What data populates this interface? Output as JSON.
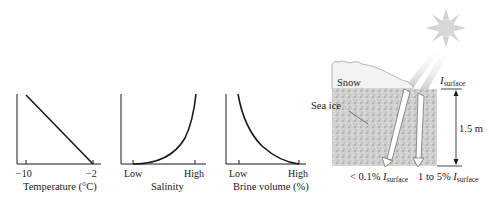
{
  "graphs": [
    {
      "id": "temperature",
      "xlabel": "Temperature (°C)",
      "ticks": [
        "−10",
        "−2"
      ],
      "trend": "linear decreasing"
    },
    {
      "id": "salinity",
      "xlabel": "Salinity",
      "ticks": [
        "Low",
        "High"
      ],
      "trend": "exponential increasing"
    },
    {
      "id": "brine",
      "xlabel": "Brine volume (%)",
      "ticks": [
        "Low",
        "High"
      ],
      "trend": "exponential decreasing"
    }
  ],
  "diagram": {
    "snow_label": "Snow",
    "sea_ice_label": "Sea ice",
    "surface_symbol": "I",
    "surface_sub": "surface",
    "thickness_label": "1.5 m",
    "bottom_left_prefix": "< 0.1% ",
    "bottom_right_prefix": "1 to 5% ",
    "sun_icon": "sun-icon"
  },
  "colors": {
    "line": "#1a1a1a",
    "snow_fill": "#f4f4f4",
    "ice_fill": "#c9c9c9",
    "sun": "#d6d6d6"
  }
}
